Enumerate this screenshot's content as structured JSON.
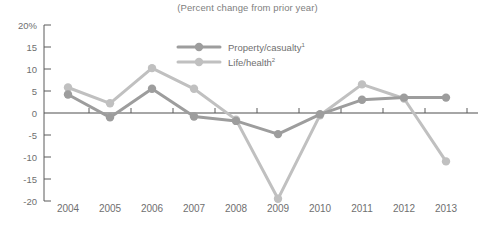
{
  "chart_data": {
    "type": "line",
    "title": "(Percent change from prior year)",
    "xlabel": "",
    "ylabel": "",
    "ylim": [
      -20,
      20
    ],
    "yticks": [
      20,
      15,
      10,
      5,
      0,
      -5,
      -10,
      -15,
      -20
    ],
    "ytick_labels": [
      "20%",
      "15",
      "10",
      "5",
      "0",
      "-5",
      "-10",
      "-15",
      "-20"
    ],
    "grid": false,
    "legend_position": "top-center",
    "categories": [
      "2004",
      "2005",
      "2006",
      "2007",
      "2008",
      "2009",
      "2010",
      "2011",
      "2012",
      "2013"
    ],
    "series": [
      {
        "name": "Property/casualty",
        "footnote_marker": "1",
        "color": "#9d9d9d",
        "values": [
          4.2,
          -1.0,
          5.5,
          -0.8,
          -1.8,
          -4.8,
          -0.3,
          3.0,
          3.5,
          3.5
        ]
      },
      {
        "name": "Life/health",
        "footnote_marker": "2",
        "color": "#c0c0c0",
        "values": [
          5.8,
          2.2,
          10.2,
          5.5,
          -1.5,
          -19.5,
          -0.5,
          6.5,
          3.3,
          -11.0
        ]
      }
    ]
  },
  "colors": {
    "property_casualty": "#9d9d9d",
    "life_health": "#c0c0c0",
    "axis": "#5a5a5a",
    "text": "#6f6f6f",
    "background": "#ffffff"
  }
}
